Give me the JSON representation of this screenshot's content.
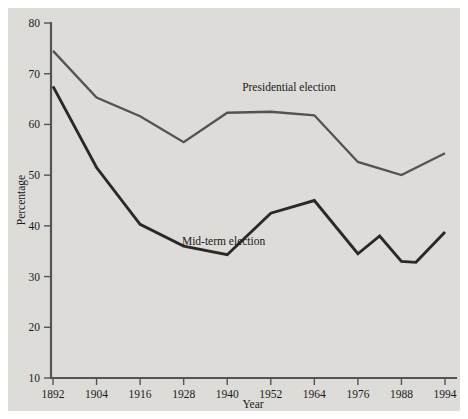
{
  "chart_data": {
    "type": "line",
    "title": "",
    "xlabel": "Year",
    "ylabel": "Percentage",
    "xlim": [
      1892,
      1994
    ],
    "ylim": [
      10,
      80
    ],
    "grid": false,
    "legend_position": "inline-annotation",
    "xticks": [
      "1892",
      "1904",
      "1916",
      "1928",
      "1940",
      "1952",
      "1964",
      "1976",
      "1988",
      "1994"
    ],
    "yticks": [
      "10",
      "20",
      "30",
      "40",
      "50",
      "60",
      "70",
      "80"
    ],
    "series": [
      {
        "name": "Presidential election",
        "color": "#55524f",
        "x": [
          1892,
          1904,
          1916,
          1928,
          1940,
          1952,
          1964,
          1976,
          1988,
          1994
        ],
        "values": [
          74.5,
          65.3,
          61.6,
          56.5,
          62.3,
          62.5,
          61.8,
          52.6,
          50.0,
          54.3
        ]
      },
      {
        "name": "Mid-term election",
        "color": "#2b2926",
        "x": [
          1892,
          1904,
          1916,
          1928,
          1940,
          1952,
          1964,
          1976,
          1982,
          1988,
          1990,
          1994
        ],
        "values": [
          67.5,
          51.5,
          40.3,
          36.0,
          34.3,
          42.5,
          45.0,
          34.5,
          38.0,
          33.0,
          32.8,
          38.8
        ]
      }
    ],
    "annotations": [
      {
        "text": "Presidential election",
        "x": 1957,
        "y": 66.5
      },
      {
        "text": "Mid-term election",
        "x": 1939,
        "y": 36.2
      }
    ]
  },
  "colors": {
    "panel_background": "#dedcd8",
    "page_background": "#ffffff",
    "axis": "#555353",
    "presidential_line": "#55524f",
    "midterm_line": "#2b2926",
    "text": "#1a1a1a"
  }
}
